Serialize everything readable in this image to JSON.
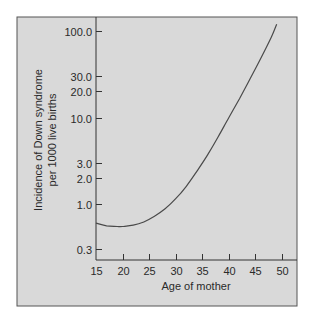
{
  "chart_data": {
    "type": "line",
    "title": "",
    "xlabel": "Age of mother",
    "ylabel": "Incidence of Down syndrome per 1000 live births",
    "ylabel_lines": [
      "Incidence of Down syndrome",
      "per 1000 live births"
    ],
    "yscale": "log",
    "xlim": [
      15,
      53
    ],
    "ylim": [
      0.25,
      130
    ],
    "grid": false,
    "legend": null,
    "x_ticks": [
      15,
      20,
      25,
      30,
      35,
      40,
      45,
      50
    ],
    "x_tick_labels": [
      "15",
      "20",
      "25",
      "30",
      "35",
      "40",
      "45",
      "50"
    ],
    "y_ticks": [
      0.3,
      1.0,
      2.0,
      3.0,
      10.0,
      20.0,
      30.0,
      100.0
    ],
    "y_tick_labels": [
      "0.3",
      "1.0",
      "2.0",
      "3.0",
      "10.0",
      "20.0",
      "30.0",
      "100.0"
    ],
    "series": [
      {
        "name": "Incidence of Down syndrome",
        "x": [
          15,
          17,
          19,
          20,
          22,
          24,
          26,
          28,
          30,
          32,
          34,
          36,
          38,
          40,
          42,
          44,
          46,
          48,
          49
        ],
        "values": [
          0.6,
          0.56,
          0.55,
          0.55,
          0.57,
          0.62,
          0.72,
          0.88,
          1.15,
          1.6,
          2.4,
          3.7,
          6.0,
          10.0,
          16.5,
          28,
          48,
          85,
          120
        ]
      }
    ]
  },
  "colors": {
    "panel_background": "#d9d9d9",
    "frame": "#555555",
    "axis": "#333333",
    "curve": "#4a4a4a",
    "text": "#2a2a2a"
  }
}
